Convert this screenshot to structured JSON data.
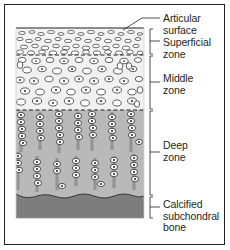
{
  "figure": {
    "type": "histology-schematic",
    "background_color": "#ffffff",
    "border_color": "#231f20"
  },
  "labels": [
    {
      "id": "articular-surface",
      "text": "Articular\nsurface",
      "connector": "leader-line",
      "x": 163,
      "y": 13
    },
    {
      "id": "superficial-zone",
      "text": "Superficial\nzone",
      "connector": "bracket",
      "x": 163,
      "y": 37
    },
    {
      "id": "middle-zone",
      "text": "Middle\nzone",
      "connector": "bracket",
      "x": 163,
      "y": 73
    },
    {
      "id": "deep-zone",
      "text": "Deep\nzone",
      "connector": "bracket",
      "x": 163,
      "y": 140
    },
    {
      "id": "calcified-subchondral-bone",
      "text": "Calcified\nsubchondral\nbone",
      "connector": "bracket",
      "x": 163,
      "y": 199
    }
  ],
  "zones": [
    {
      "id": "superficial",
      "top": 28,
      "bottom": 55,
      "fill": "#f2f2f2",
      "cell_shape": "flattened-ellipse",
      "cell_orientation": "horizontal"
    },
    {
      "id": "middle",
      "top": 55,
      "bottom": 110,
      "fill": "#f0f0f0",
      "cell_shape": "round-ellipse",
      "cell_orientation": "random"
    },
    {
      "id": "deep",
      "top": 110,
      "bottom": 196,
      "fill": "#b8b8b8",
      "cell_shape": "stacked-ellipse",
      "cell_orientation": "vertical-columns"
    },
    {
      "id": "calcified-bone",
      "top": 196,
      "bottom": 218,
      "fill": "#7d7d7d",
      "cell_shape": "none",
      "cell_orientation": "none"
    }
  ],
  "boundaries": [
    {
      "id": "articular-surface-line",
      "y": 28,
      "style": "solid",
      "color": "#231f20"
    },
    {
      "id": "superficial-middle-boundary",
      "y": 55,
      "style": "dashed",
      "color": "#231f20"
    },
    {
      "id": "middle-deep-boundary",
      "y": 110,
      "style": "dashed",
      "color": "#231f20"
    },
    {
      "id": "tidemark",
      "y": 196,
      "style": "wavy",
      "color": "#4a4a4a"
    }
  ],
  "colors": {
    "ink": "#231f20",
    "superficial_fill": "#f2f2f2",
    "middle_fill": "#f0f0f0",
    "deep_fill": "#b8b8b8",
    "bone_fill": "#7d7d7d",
    "cell_fill": "#ffffff",
    "nucleus_fill": "#231f20"
  }
}
